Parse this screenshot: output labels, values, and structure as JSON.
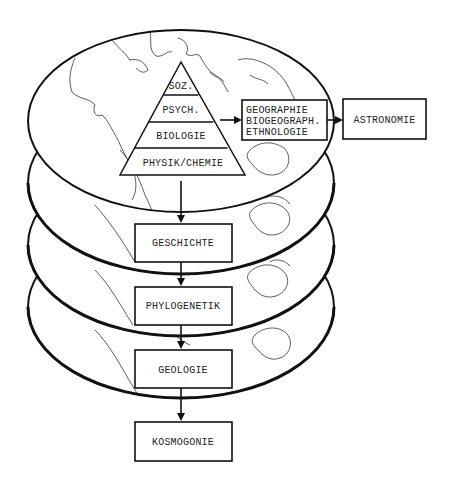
{
  "diagram": {
    "type": "stacked-earth-layers-hierarchy",
    "pyramid": {
      "levels": [
        {
          "label": "SOZ."
        },
        {
          "label": "PSYCH."
        },
        {
          "label": "BIOLOGIE"
        },
        {
          "label": "PHYSIK/CHEMIE"
        }
      ]
    },
    "side_box": {
      "lines": [
        "GEOGRAPHIE",
        "BIOGEOGRAPH.",
        "ETHNOLOGIE"
      ]
    },
    "astronomy_box": {
      "label": "ASTRONOMIE"
    },
    "chain": [
      {
        "label": "GESCHICHTE"
      },
      {
        "label": "PHYLOGENETIK"
      },
      {
        "label": "GEOLOGIE"
      },
      {
        "label": "KOSMOGONIE"
      }
    ],
    "layer_count": 4,
    "colors": {
      "ink": "#111111",
      "background": "#ffffff",
      "coast": "#333333"
    }
  }
}
